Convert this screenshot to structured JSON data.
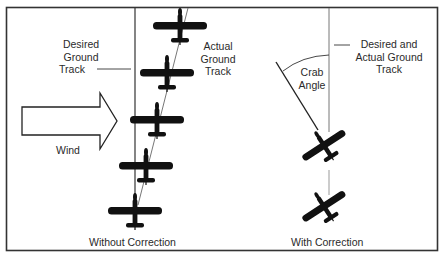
{
  "diagram": {
    "type": "crab angle wind correction illustration",
    "colors": {
      "frame": "#333333",
      "aircraft": "#111111",
      "track_line": "#555555",
      "text": "#2a2a2a",
      "background": "#ffffff"
    },
    "left_panel": {
      "caption": "Without Correction",
      "labels": {
        "desired_track": [
          "Desired",
          "Ground",
          "Track"
        ],
        "actual_track": [
          "Actual",
          "Ground",
          "Track"
        ],
        "wind": "Wind"
      },
      "wind_arrow": {
        "icon": "wind-arrow-icon",
        "direction": "right"
      },
      "aircraft_count": 5,
      "aircraft_heading": "north (wings level, drifting right)"
    },
    "right_panel": {
      "caption": "With Correction",
      "labels": {
        "desired_actual_track": [
          "Desired and",
          "Actual Ground",
          "Track"
        ],
        "crab_angle": [
          "Crab",
          "Angle"
        ]
      },
      "aircraft_count": 2,
      "aircraft_heading": "crabbed into wind (nose pointed left of track)"
    }
  }
}
